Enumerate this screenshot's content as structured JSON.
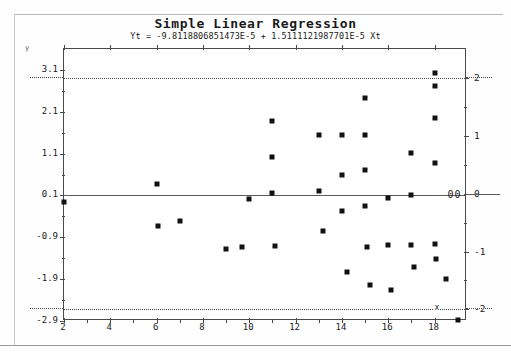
{
  "chart_data": {
    "type": "scatter",
    "title": "Simple Linear Regression",
    "subtitle": "Yt = -9.8118806851473E-5 + 1.5111121987701E-5 Xt",
    "xlabel": "x",
    "ylabel": "y",
    "xlim": [
      2,
      19.4
    ],
    "ylim": [
      -2.9,
      3.6
    ],
    "right_ylim": [
      -2.2,
      2.5
    ],
    "grid": false,
    "legend": null,
    "x_ticks": [
      2,
      4,
      6,
      8,
      10,
      12,
      14,
      16,
      18
    ],
    "x_tick_labels": [
      "2",
      "4",
      "6",
      "8",
      "10",
      "12",
      "14",
      "16",
      "18"
    ],
    "y_ticks": [
      3.1,
      2.1,
      1.1,
      0.1,
      -0.9,
      -1.9,
      -2.9
    ],
    "y_tick_labels": [
      "3.1",
      "2.1",
      "1.1",
      "0.1",
      "-0.9",
      "-1.9",
      "-2.9"
    ],
    "right_y_ticks": [
      2,
      1,
      0,
      -1,
      -2
    ],
    "right_y_tick_labels": [
      "2",
      "1",
      "0",
      "-1",
      "-2"
    ],
    "reference_lines": [
      {
        "name": "regression-line",
        "y": 0.1,
        "style": "solid"
      },
      {
        "name": "upper-limit-line",
        "y": 2.0,
        "style": "dotted",
        "right_axis_value": 2
      },
      {
        "name": "lower-limit-line",
        "y": -2.2,
        "style": "dotted",
        "right_axis_value": -2
      }
    ],
    "annotations": [
      {
        "name": "zero-marker",
        "text": "00",
        "x": 18.6,
        "y": 0.1
      },
      {
        "name": "x-axis-label",
        "text": "x",
        "x": 18.0,
        "y": -2.2
      },
      {
        "name": "y-axis-label",
        "text": "y",
        "x": 2.0,
        "y": 3.6
      }
    ],
    "points": [
      {
        "x": 2.0,
        "y": -0.05
      },
      {
        "x": 6.0,
        "y": 0.38
      },
      {
        "x": 6.05,
        "y": -0.62
      },
      {
        "x": 7.0,
        "y": -0.5
      },
      {
        "x": 9.0,
        "y": -1.18
      },
      {
        "x": 9.7,
        "y": -1.12
      },
      {
        "x": 10.0,
        "y": 0.02
      },
      {
        "x": 11.0,
        "y": 1.88
      },
      {
        "x": 11.0,
        "y": 1.02
      },
      {
        "x": 11.0,
        "y": 0.16
      },
      {
        "x": 11.1,
        "y": -1.1
      },
      {
        "x": 13.0,
        "y": 1.55
      },
      {
        "x": 13.0,
        "y": 0.2
      },
      {
        "x": 13.2,
        "y": -0.75
      },
      {
        "x": 14.0,
        "y": 1.55
      },
      {
        "x": 14.0,
        "y": 0.58
      },
      {
        "x": 14.0,
        "y": -0.28
      },
      {
        "x": 14.2,
        "y": -1.72
      },
      {
        "x": 15.0,
        "y": 2.42
      },
      {
        "x": 15.0,
        "y": 1.55
      },
      {
        "x": 15.0,
        "y": 0.72
      },
      {
        "x": 15.0,
        "y": -0.15
      },
      {
        "x": 15.1,
        "y": -1.12
      },
      {
        "x": 15.2,
        "y": -2.05
      },
      {
        "x": 16.0,
        "y": 0.05
      },
      {
        "x": 16.0,
        "y": -1.08
      },
      {
        "x": 16.1,
        "y": -2.15
      },
      {
        "x": 17.0,
        "y": 1.12
      },
      {
        "x": 17.0,
        "y": 0.12
      },
      {
        "x": 17.0,
        "y": -1.08
      },
      {
        "x": 17.1,
        "y": -1.6
      },
      {
        "x": 18.0,
        "y": 2.72
      },
      {
        "x": 18.0,
        "y": 3.02
      },
      {
        "x": 18.0,
        "y": 1.95
      },
      {
        "x": 18.0,
        "y": 0.88
      },
      {
        "x": 18.0,
        "y": -1.05
      },
      {
        "x": 18.05,
        "y": -1.42
      },
      {
        "x": 18.5,
        "y": -1.9
      },
      {
        "x": 19.0,
        "y": -2.88
      }
    ]
  }
}
